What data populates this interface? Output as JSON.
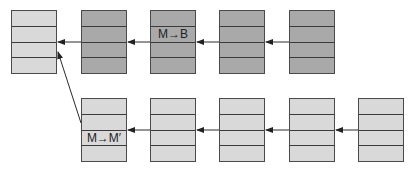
{
  "diagram": {
    "title": "",
    "colors": {
      "light_block": "#d9d9d9",
      "dark_block": "#a9a9a9",
      "line": "#3a3a3a",
      "background": "#ffffff"
    },
    "top_row": {
      "blocks": [
        {
          "id": "T1",
          "shade": "light",
          "rows": [
            "",
            "",
            "",
            ""
          ]
        },
        {
          "id": "T2",
          "shade": "dark",
          "rows": [
            "",
            "",
            "",
            ""
          ]
        },
        {
          "id": "T3",
          "shade": "dark",
          "rows": [
            "",
            "M→B",
            "",
            ""
          ]
        },
        {
          "id": "T4",
          "shade": "dark",
          "rows": [
            "",
            "",
            "",
            ""
          ]
        },
        {
          "id": "T5",
          "shade": "dark",
          "rows": [
            "",
            "",
            "",
            ""
          ]
        }
      ]
    },
    "bottom_row": {
      "blocks": [
        {
          "id": "B1",
          "shade": "light",
          "rows": [
            "",
            "",
            "M→M′",
            ""
          ]
        },
        {
          "id": "B2",
          "shade": "light",
          "rows": [
            "",
            "",
            "",
            ""
          ]
        },
        {
          "id": "B3",
          "shade": "light",
          "rows": [
            "",
            "",
            "",
            ""
          ]
        },
        {
          "id": "B4",
          "shade": "light",
          "rows": [
            "",
            "",
            "",
            ""
          ]
        },
        {
          "id": "B5",
          "shade": "light",
          "rows": [
            "",
            "",
            "",
            ""
          ]
        }
      ]
    },
    "edges": [
      {
        "from": "T5",
        "to": "T4"
      },
      {
        "from": "T4",
        "to": "T3"
      },
      {
        "from": "T3",
        "to": "T2"
      },
      {
        "from": "T2",
        "to": "T1"
      },
      {
        "from": "B5",
        "to": "B4"
      },
      {
        "from": "B4",
        "to": "B3"
      },
      {
        "from": "B3",
        "to": "B2"
      },
      {
        "from": "B2",
        "to": "B1"
      },
      {
        "from": "B1",
        "to": "T1"
      }
    ],
    "labels": {
      "top_label": "M→B",
      "bottom_label": "M→M′"
    }
  }
}
